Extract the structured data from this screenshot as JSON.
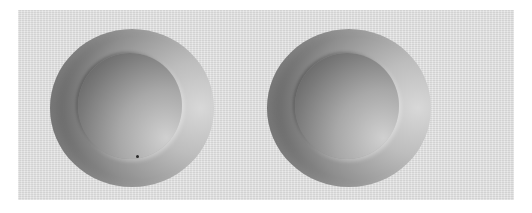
{
  "figure": {
    "background_color": "#e2e2e2",
    "objects": [
      {
        "name": "left-sphere",
        "center": [
          130,
          107
        ],
        "radius": 82,
        "inner_disc_radius": 52
      },
      {
        "name": "right-sphere",
        "center": [
          347,
          107
        ],
        "radius": 82,
        "inner_disc_radius": 52
      }
    ]
  }
}
